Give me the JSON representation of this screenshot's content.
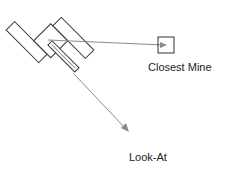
{
  "diagram": {
    "labels": {
      "closest_mine": "Closest Mine",
      "look_at": "Look-At"
    },
    "colors": {
      "outline": "#333333",
      "vector": "#8a8a8a",
      "background": "#ffffff"
    },
    "elements": [
      "tank",
      "closest-mine-marker",
      "mine-vector",
      "look-at-vector"
    ]
  }
}
